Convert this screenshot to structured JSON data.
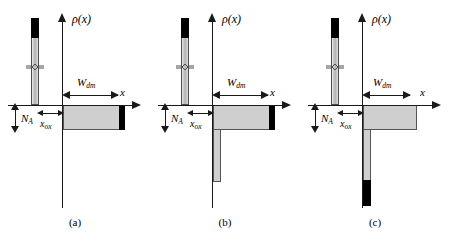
{
  "figure": {
    "axis_labels": {
      "y": "ρ(x)",
      "x": "x"
    },
    "dimension_labels": {
      "w_dm_symbol": "W",
      "w_dm_subscript": "dm",
      "n_a_symbol": "N",
      "n_a_subscript": "A",
      "x_ox_symbol": "x",
      "x_ox_subscript": "ox"
    },
    "colors": {
      "depletion_fill": "#cfcfcf",
      "charge_sheet": "#000000",
      "gate_bar_fill": "#c9c9c9",
      "axis": "#1a1a1a",
      "outline": "#555555",
      "background": "#ffffff"
    },
    "panels": [
      {
        "id": "a",
        "caption": "(a)",
        "w_dm_width_px": 56,
        "has_right_charge_sheet": true,
        "has_inversion_column": false,
        "inversion_column_height_px": 0,
        "inversion_column_black_height_px": 0
      },
      {
        "id": "b",
        "caption": "(b)",
        "w_dm_width_px": 56,
        "has_right_charge_sheet": true,
        "has_inversion_column": true,
        "inversion_column_height_px": 52,
        "inversion_column_black_height_px": 0
      },
      {
        "id": "c",
        "caption": "(c)",
        "w_dm_width_px": 48,
        "has_right_charge_sheet": false,
        "has_inversion_column": true,
        "inversion_column_height_px": 76,
        "inversion_column_black_height_px": 26
      }
    ]
  }
}
